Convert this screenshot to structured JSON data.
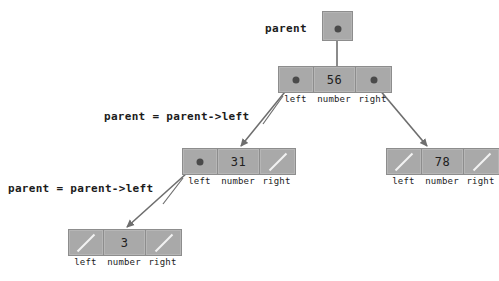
{
  "diagram": {
    "colors": {
      "node_fill": "#a9a9a9",
      "node_border": "#8d8d8d",
      "null_slash": "#f2f2f2",
      "pointer_dot": "#4a4a4a",
      "edge": "#6e6e6e",
      "text": "#1b1b1b",
      "background": "#ffffff"
    },
    "pointer_variable": {
      "label": "parent"
    },
    "cell_captions": {
      "left": "left",
      "number": "number",
      "right": "right"
    },
    "nodes": [
      {
        "id": "root",
        "value": "56",
        "left": "pointer",
        "right": "pointer"
      },
      {
        "id": "node-31",
        "value": "31",
        "left": "pointer",
        "right": "null"
      },
      {
        "id": "node-78",
        "value": "78",
        "left": "null",
        "right": "null"
      },
      {
        "id": "node-3",
        "value": "3",
        "left": "null",
        "right": "null"
      }
    ],
    "annotations": [
      {
        "id": "annot-1",
        "text": "parent = parent->left"
      },
      {
        "id": "annot-2",
        "text": "parent = parent->left"
      }
    ]
  }
}
